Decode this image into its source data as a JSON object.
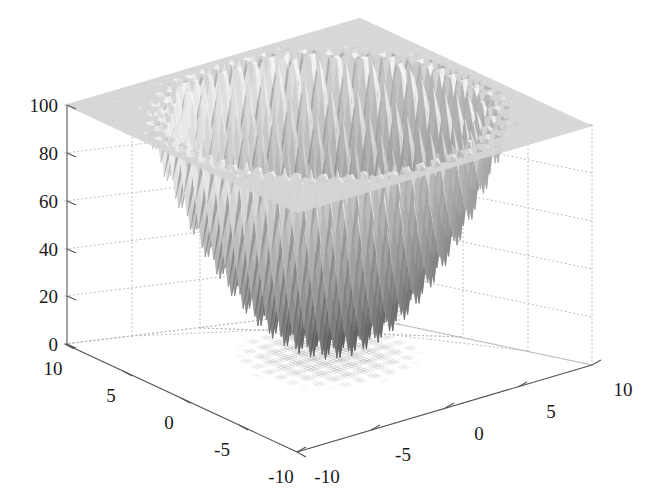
{
  "figure": {
    "title": "",
    "background_color": "#ffffff",
    "width": 650,
    "height": 501
  },
  "axes": {
    "z": {
      "label": "",
      "ticks": [
        "100",
        "80",
        "60",
        "40",
        "20",
        "0"
      ],
      "values": [
        100,
        80,
        60,
        40,
        20,
        0
      ],
      "range": [
        0,
        100
      ]
    },
    "y": {
      "label": "",
      "ticks": [
        "10",
        "5",
        "0",
        "-5",
        "-10"
      ],
      "values": [
        10,
        5,
        0,
        -5,
        -10
      ],
      "range": [
        -10,
        10
      ]
    },
    "x": {
      "label": "",
      "ticks": [
        "-10",
        "-5",
        "0",
        "5",
        "10"
      ],
      "values": [
        -10,
        -5,
        0,
        5,
        10
      ],
      "range": [
        -10,
        10
      ]
    }
  },
  "style": {
    "axis_color": "#555555",
    "grid_color": "#b8b8b8",
    "tick_label_color": "#1a1a1a",
    "surface_light": "#e8e8e8",
    "surface_mid": "#b4b4b4",
    "surface_dark": "#6e6e6e",
    "surface_darkest": "#565656"
  },
  "chart_data": {
    "type": "surface",
    "title": "",
    "xlabel": "",
    "ylabel": "",
    "zlabel": "",
    "function": "Rastrigin",
    "formula": "f(x,y) = 20 + x^2 + y^2 - 10*(cos(2*pi*x) + cos(2*pi*y))",
    "xlim": [
      -10,
      10
    ],
    "ylim": [
      -10,
      10
    ],
    "zlim": [
      0,
      100
    ],
    "xticks": [
      -10,
      -5,
      0,
      5,
      10
    ],
    "yticks": [
      -10,
      -5,
      0,
      5,
      10
    ],
    "zticks": [
      0,
      20,
      40,
      60,
      80,
      100
    ],
    "grid": true,
    "legend": false,
    "colormap": "gray",
    "shading": "interp",
    "samples": 81,
    "peak_value": 90,
    "min_value": 0,
    "view_azimuth": -37.5,
    "view_elevation": 30
  }
}
